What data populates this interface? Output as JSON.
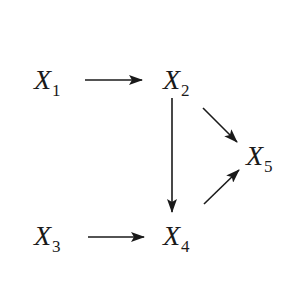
{
  "diagram": {
    "type": "directed-graph",
    "colors": {
      "stroke": "#1a1a1a",
      "background": "#ffffff"
    },
    "nodes": [
      {
        "id": "X1",
        "base": "X",
        "sub": "1",
        "x": 34,
        "y": 66
      },
      {
        "id": "X2",
        "base": "X",
        "sub": "2",
        "x": 163,
        "y": 66
      },
      {
        "id": "X3",
        "base": "X",
        "sub": "3",
        "x": 34,
        "y": 222
      },
      {
        "id": "X4",
        "base": "X",
        "sub": "4",
        "x": 163,
        "y": 222
      },
      {
        "id": "X5",
        "base": "X",
        "sub": "5",
        "x": 246,
        "y": 142
      }
    ],
    "edges": [
      {
        "from": "X1",
        "to": "X2",
        "x1": 85,
        "y1": 80,
        "x2": 142,
        "y2": 80
      },
      {
        "from": "X2",
        "to": "X4",
        "x1": 172,
        "y1": 98,
        "x2": 172,
        "y2": 212
      },
      {
        "from": "X2",
        "to": "X5",
        "x1": 203,
        "y1": 108,
        "x2": 237,
        "y2": 142
      },
      {
        "from": "X3",
        "to": "X4",
        "x1": 88,
        "y1": 237,
        "x2": 144,
        "y2": 237
      },
      {
        "from": "X4",
        "to": "X5",
        "x1": 204,
        "y1": 204,
        "x2": 239,
        "y2": 170
      }
    ]
  }
}
